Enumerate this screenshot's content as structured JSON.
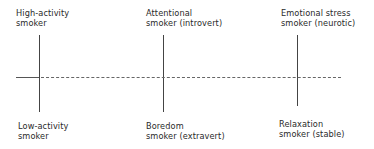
{
  "diagram": {
    "top_labels": [
      {
        "line1": "High-activity",
        "line2": "smoker"
      },
      {
        "line1": "Attentional",
        "line2": "smoker  (introvert)"
      },
      {
        "line1": "Emotional stress",
        "line2": "smoker  (neurotic)"
      }
    ],
    "bottom_labels": [
      {
        "line1": "Low-activity",
        "line2": "smoker"
      },
      {
        "line1": "Boredom",
        "line2": "smoker  (extravert)"
      },
      {
        "line1": "Relaxation",
        "line2": "smoker  (stable)"
      }
    ]
  }
}
